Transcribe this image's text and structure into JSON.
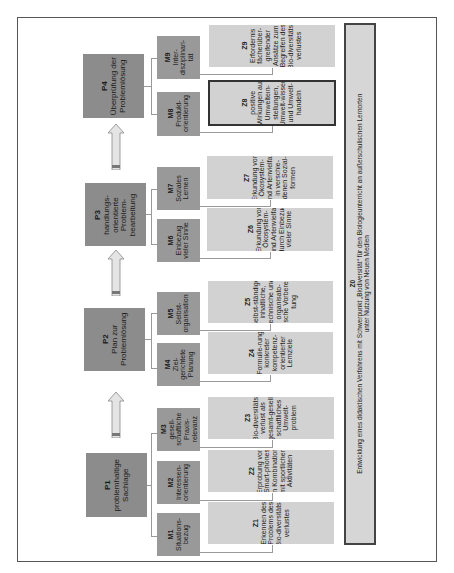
{
  "diagram": {
    "orientation": "rotated -90deg (text reads bottom-to-top)",
    "phases": [
      {
        "id": "P1",
        "label": "problemhaltige Sachlage"
      },
      {
        "id": "P2",
        "label": "Plan zur Problemlösung"
      },
      {
        "id": "P3",
        "label": "handlungs-orientierte Problem-bearbeitung"
      },
      {
        "id": "P4",
        "label": "Überprüfung der Problemlösung"
      }
    ],
    "methods": [
      {
        "id": "M1",
        "label": "Situations-bezug"
      },
      {
        "id": "M2",
        "label": "Interessen-orientierung"
      },
      {
        "id": "M3",
        "label": "gesell-schaftliche Praxis-relevanz"
      },
      {
        "id": "M4",
        "label": "Ziel-gerichtete Planung"
      },
      {
        "id": "M5",
        "label": "Selbst-organisation"
      },
      {
        "id": "M6",
        "label": "Einbezug vieler Sinne"
      },
      {
        "id": "M7",
        "label": "Soziales Lernen"
      },
      {
        "id": "M8",
        "label": "Produkt-orientierung"
      },
      {
        "id": "M9",
        "label": "Inter-disziplinari-tät"
      }
    ],
    "goals": [
      {
        "id": "Z1",
        "label": "Erkennen des Problems des Bio-diversitäts-verlustes"
      },
      {
        "id": "Z2",
        "label": "Erprobung von Smart-phones in Kombination mit sportlichen Aktivitäten"
      },
      {
        "id": "Z3",
        "label": "Bio-diversitäts-verlust als gesamt-gesell-schaftliches Umwelt-problem"
      },
      {
        "id": "Z4",
        "label": "Formulie-rung konkreter kompetenz-orientierter Lernziele"
      },
      {
        "id": "Z5",
        "label": "selbst-ständige inhaltliche, technische und organisato-rische Vorberei-tung"
      },
      {
        "id": "Z6",
        "label": "Erkundung von Ökosystem- und Artenvielfalt durch Einbezug vieler Sinne"
      },
      {
        "id": "Z7",
        "label": "Erkundung von Ökosystem- und Artenvielfalt in verschie-denen Sozial-formen"
      },
      {
        "id": "Z8",
        "label": "positive Wirkungen auf Umwelteın-stellungen, Umwelt-wissen und Umwelt-handeln",
        "highlighted": true
      },
      {
        "id": "Z9",
        "label": "Erfordernis fächerüber-greifender Ansätze zum Begreifen des Bio-diversitäts-verlustes"
      }
    ],
    "overall_goal": {
      "id": "Z0",
      "label": "Entwicklung eines didaktischen Verfahrens mit Schwerpunkt „Biodiversität“ für den Biologieunterricht an außerschulischen Lernorten",
      "label2": "unter Nutzung von Neuen Medien"
    },
    "colors": {
      "phase_fill": "#8c8c8c",
      "method_fill": "#999999",
      "goal_fill": "#d2d2d2",
      "arrow_fill": "#e4e4e4",
      "frame": "#555555"
    }
  }
}
